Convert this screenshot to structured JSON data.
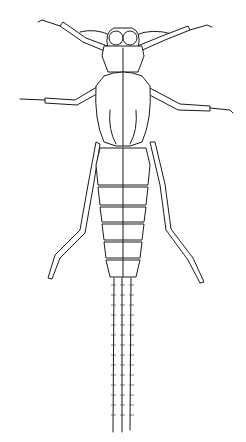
{
  "image": {
    "subject": "insect nymph line drawing (dorsal view)",
    "background_color": "#ffffff",
    "line_color": "#1a1a1a",
    "parts": [
      "antennae",
      "head",
      "pronotum",
      "wing-pads",
      "forelegs",
      "midlegs",
      "hindlegs",
      "abdomen",
      "cerci"
    ]
  }
}
